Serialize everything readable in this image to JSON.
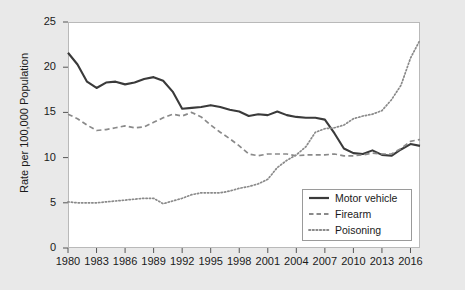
{
  "chart_data": {
    "type": "line",
    "title": "",
    "xlabel": "",
    "ylabel": "Rate per 100,000 Population",
    "xlim": [
      1980,
      2017
    ],
    "ylim": [
      0,
      25
    ],
    "yticks": [
      0,
      5,
      10,
      15,
      20,
      25
    ],
    "xticks": [
      1980,
      1983,
      1986,
      1989,
      1992,
      1995,
      1998,
      2001,
      2004,
      2007,
      2010,
      2013,
      2016
    ],
    "grid": false,
    "legend_position": "lower-right",
    "x": [
      1980,
      1981,
      1982,
      1983,
      1984,
      1985,
      1986,
      1987,
      1988,
      1989,
      1990,
      1991,
      1992,
      1993,
      1994,
      1995,
      1996,
      1997,
      1998,
      1999,
      2000,
      2001,
      2002,
      2003,
      2004,
      2005,
      2006,
      2007,
      2008,
      2009,
      2010,
      2011,
      2012,
      2013,
      2014,
      2015,
      2016,
      2017
    ],
    "series": [
      {
        "name": "Motor vehicle",
        "style": "solid",
        "color": "#3a3a3a",
        "values": [
          21.6,
          20.3,
          18.4,
          17.7,
          18.3,
          18.4,
          18.1,
          18.3,
          18.7,
          18.9,
          18.5,
          17.3,
          15.4,
          15.5,
          15.6,
          15.8,
          15.6,
          15.3,
          15.1,
          14.6,
          14.8,
          14.7,
          15.1,
          14.7,
          14.5,
          14.4,
          14.4,
          14.2,
          12.7,
          11.0,
          10.5,
          10.4,
          10.8,
          10.3,
          10.2,
          10.9,
          11.5,
          11.3
        ]
      },
      {
        "name": "Firearm",
        "style": "dashed",
        "color": "#8a8a8a",
        "values": [
          14.8,
          14.3,
          13.6,
          13.0,
          13.1,
          13.3,
          13.5,
          13.3,
          13.4,
          13.9,
          14.4,
          14.8,
          14.6,
          15.0,
          14.5,
          13.6,
          12.8,
          12.1,
          11.3,
          10.4,
          10.2,
          10.4,
          10.4,
          10.4,
          10.2,
          10.3,
          10.3,
          10.3,
          10.4,
          10.2,
          10.2,
          10.3,
          10.5,
          10.4,
          10.4,
          11.0,
          11.8,
          12.0
        ]
      },
      {
        "name": "Poisoning",
        "style": "dotted",
        "color": "#8a8a8a",
        "values": [
          5.1,
          5.0,
          5.0,
          5.0,
          5.1,
          5.2,
          5.3,
          5.4,
          5.5,
          5.5,
          4.9,
          5.2,
          5.5,
          5.9,
          6.1,
          6.1,
          6.1,
          6.3,
          6.6,
          6.8,
          7.1,
          7.6,
          8.9,
          9.7,
          10.3,
          11.2,
          12.8,
          13.2,
          13.3,
          13.6,
          14.3,
          14.6,
          14.8,
          15.2,
          16.4,
          18.0,
          21.0,
          23.0
        ]
      }
    ]
  },
  "axis": {
    "ytick_labels": [
      "0",
      "5",
      "10",
      "15",
      "20",
      "25"
    ],
    "xtick_labels": [
      "1980",
      "1983",
      "1986",
      "1989",
      "1992",
      "1995",
      "1998",
      "2001",
      "2004",
      "2007",
      "2010",
      "2013",
      "2016"
    ]
  },
  "legend": {
    "items": [
      {
        "label": "Motor vehicle"
      },
      {
        "label": "Firearm"
      },
      {
        "label": "Poisoning"
      }
    ]
  }
}
